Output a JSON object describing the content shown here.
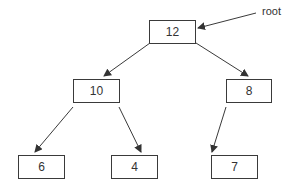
{
  "diagram": {
    "type": "binary-tree",
    "colors": {
      "line": "#3a3a3a",
      "text": "#333333",
      "background": "#ffffff"
    },
    "annotation": {
      "label": "root",
      "points_to": "n12"
    },
    "nodes": [
      {
        "id": "n12",
        "value": "12",
        "x": 149,
        "y": 20,
        "w": 47,
        "h": 24
      },
      {
        "id": "n10",
        "value": "10",
        "x": 73,
        "y": 79,
        "w": 47,
        "h": 24
      },
      {
        "id": "n8",
        "value": "8",
        "x": 226,
        "y": 79,
        "w": 46,
        "h": 24
      },
      {
        "id": "n6",
        "value": "6",
        "x": 18,
        "y": 155,
        "w": 47,
        "h": 24
      },
      {
        "id": "n4",
        "value": "4",
        "x": 111,
        "y": 155,
        "w": 47,
        "h": 24
      },
      {
        "id": "n7",
        "value": "7",
        "x": 211,
        "y": 155,
        "w": 47,
        "h": 24
      }
    ],
    "edges": [
      {
        "from": "n12",
        "to": "n10",
        "x1": 150,
        "y1": 43,
        "x2": 104,
        "y2": 76
      },
      {
        "from": "n12",
        "to": "n8",
        "x1": 196,
        "y1": 43,
        "x2": 248,
        "y2": 76
      },
      {
        "from": "n10",
        "to": "n6",
        "x1": 73,
        "y1": 107,
        "x2": 35,
        "y2": 152
      },
      {
        "from": "n10",
        "to": "n4",
        "x1": 119,
        "y1": 107,
        "x2": 141,
        "y2": 152
      },
      {
        "from": "n8",
        "to": "n7",
        "x1": 226,
        "y1": 107,
        "x2": 212,
        "y2": 152
      },
      {
        "from": "root-label",
        "to": "n12",
        "x1": 256,
        "y1": 13,
        "x2": 198,
        "y2": 28
      }
    ]
  }
}
